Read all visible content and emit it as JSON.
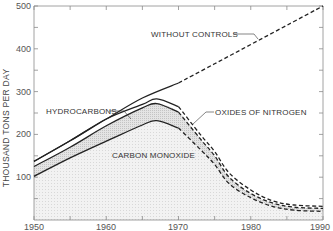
{
  "chart_data": {
    "type": "line",
    "title": "",
    "xlabel": "",
    "ylabel": "THOUSAND TONS PER DAY",
    "xlim": [
      1950,
      1990
    ],
    "ylim": [
      0,
      500
    ],
    "x_ticks": [
      1950,
      1960,
      1970,
      1980,
      1990
    ],
    "y_ticks": [
      100,
      200,
      300,
      400,
      500
    ],
    "grid": false,
    "legend": "none (inline annotations)",
    "series": [
      {
        "name": "WITHOUT CONTROLS",
        "x": [
          1950,
          1955,
          1960,
          1965,
          1970,
          1975,
          1980,
          1985,
          1990
        ],
        "values": [
          137,
          185,
          236,
          285,
          320,
          365,
          410,
          455,
          500
        ],
        "style": "solid until 1970, dashed after"
      },
      {
        "name": "HYDROCARBONS",
        "x": [
          1950,
          1955,
          1960,
          1965,
          1967,
          1970,
          1973,
          1975,
          1977,
          1980,
          1983,
          1986,
          1990
        ],
        "values": [
          137,
          185,
          236,
          270,
          283,
          265,
          200,
          160,
          110,
          70,
          45,
          35,
          32
        ],
        "style": "solid until 1970, dashed after"
      },
      {
        "name": "OXIDES OF NITROGEN",
        "x": [
          1950,
          1955,
          1960,
          1965,
          1967,
          1970,
          1973,
          1975,
          1977,
          1980,
          1983,
          1986,
          1990
        ],
        "values": [
          125,
          170,
          220,
          262,
          272,
          252,
          190,
          150,
          100,
          62,
          40,
          30,
          27
        ],
        "style": "solid until 1970, dashed after"
      },
      {
        "name": "CARBON MONOXIDE",
        "x": [
          1950,
          1955,
          1960,
          1965,
          1967,
          1970,
          1973,
          1975,
          1977,
          1980,
          1983,
          1986,
          1990
        ],
        "values": [
          102,
          145,
          184,
          222,
          232,
          215,
          165,
          130,
          85,
          52,
          32,
          23,
          20
        ],
        "style": "solid until 1970, dashed after"
      }
    ],
    "annotations": [
      {
        "text": "WITHOUT CONTROLS",
        "x": 1960,
        "y": 435
      },
      {
        "text": "HYDROCARBONS",
        "x": 1952,
        "y": 245
      },
      {
        "text": "OXIDES OF NITROGEN",
        "x": 1973,
        "y": 245
      },
      {
        "text": "CARBON MONOXIDE",
        "x": 1959,
        "y": 165
      }
    ]
  },
  "axis": {
    "x_tick_labels": [
      "1950",
      "1960",
      "1970",
      "1980",
      "1990"
    ],
    "y_tick_labels": [
      "100",
      "200",
      "300",
      "400",
      "500"
    ],
    "y_title": "THOUSAND TONS PER DAY"
  },
  "labels": {
    "without_controls": "WITHOUT CONTROLS",
    "hydrocarbons": "HYDROCARBONS",
    "oxides_of_nitrogen": "OXIDES OF NITROGEN",
    "carbon_monoxide": "CARBON MONOXIDE"
  },
  "colors": {
    "line": "#222222",
    "band_fill": "#dcdcdc",
    "area_fill": "#f0f0f0",
    "axis": "#888888"
  }
}
